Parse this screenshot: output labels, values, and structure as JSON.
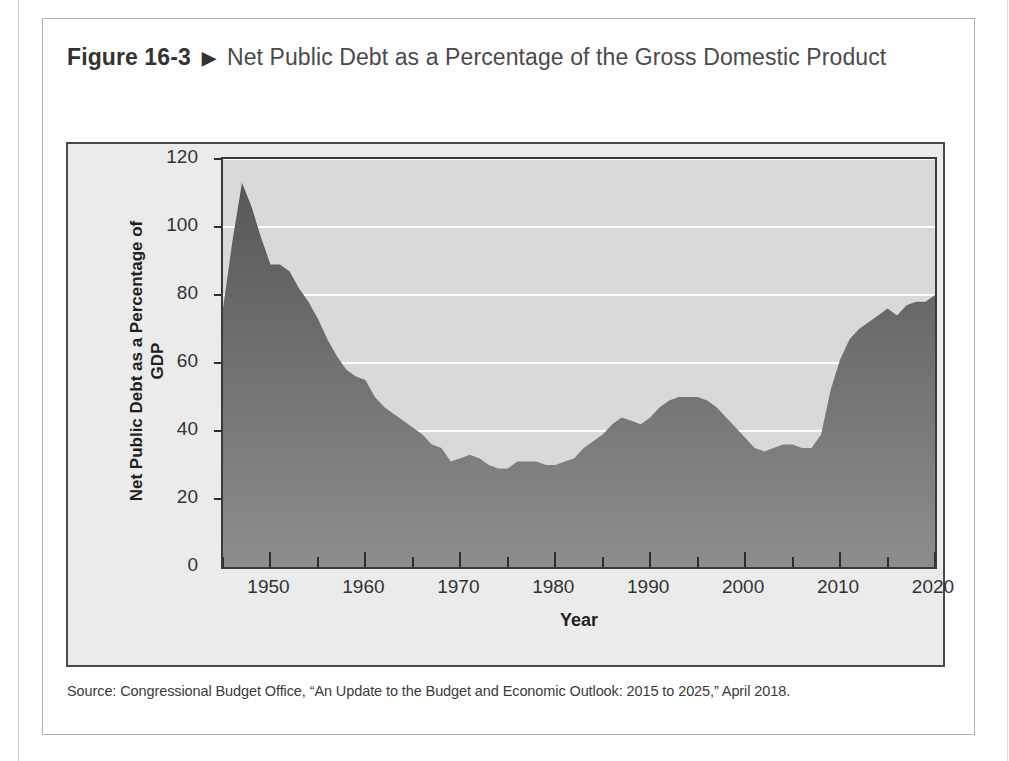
{
  "figure": {
    "number": "Figure 16-3",
    "arrow_icon": "triangle-right-icon",
    "caption": "Net Public Debt as a Percentage of the Gross Domestic Product",
    "source_note": "Source: Congressional Budget Office, “An Update to the Budget and Economic Outlook: 2015 to 2025,” April 2018."
  },
  "colors": {
    "area_fill_top": "#575757",
    "area_fill_bottom": "#8d8d8d",
    "plot_background": "#d9d9d9",
    "panel_background": "#ebebeb",
    "gridline": "#ffffff",
    "axis": "#3a3a3a",
    "text": "#333333"
  },
  "chart_data": {
    "type": "area",
    "title": "Net Public Debt as a Percentage of the Gross Domestic Product",
    "xlabel": "Year",
    "ylabel": "Net Public Debt as a Percentage of GDP",
    "xlim": [
      1945,
      2020
    ],
    "ylim": [
      0,
      120
    ],
    "ytick_labels": [
      "0",
      "20",
      "40",
      "60",
      "80",
      "100",
      "120"
    ],
    "ytick_values": [
      0,
      20,
      40,
      60,
      80,
      100,
      120
    ],
    "xtick_labels": [
      "1950",
      "1960",
      "1970",
      "1980",
      "1990",
      "2000",
      "2010",
      "2020"
    ],
    "xtick_values": [
      1950,
      1960,
      1970,
      1980,
      1990,
      2000,
      2010,
      2020
    ],
    "xtick_minor_values": [
      1945,
      1955,
      1965,
      1975,
      1985,
      1995,
      2005,
      2015
    ],
    "grid": "horizontal",
    "legend": "none",
    "series": [
      {
        "name": "Net Public Debt as a Percentage of GDP",
        "x": [
          1945,
          1946,
          1947,
          1948,
          1949,
          1950,
          1951,
          1952,
          1953,
          1954,
          1955,
          1956,
          1957,
          1958,
          1959,
          1960,
          1961,
          1962,
          1963,
          1964,
          1965,
          1966,
          1967,
          1968,
          1969,
          1970,
          1971,
          1972,
          1973,
          1974,
          1975,
          1976,
          1977,
          1978,
          1979,
          1980,
          1981,
          1982,
          1983,
          1984,
          1985,
          1986,
          1987,
          1988,
          1989,
          1990,
          1991,
          1992,
          1993,
          1994,
          1995,
          1996,
          1997,
          1998,
          1999,
          2000,
          2001,
          2002,
          2003,
          2004,
          2005,
          2006,
          2007,
          2008,
          2009,
          2010,
          2011,
          2012,
          2013,
          2014,
          2015,
          2016,
          2017,
          2018,
          2019,
          2020
        ],
        "values": [
          76,
          96,
          113,
          106,
          97,
          89,
          89,
          87,
          82,
          78,
          73,
          67,
          62,
          58,
          56,
          55,
          50,
          47,
          45,
          43,
          41,
          39,
          36,
          35,
          31,
          32,
          33,
          32,
          30,
          29,
          29,
          31,
          31,
          31,
          30,
          30,
          31,
          32,
          35,
          37,
          39,
          42,
          44,
          43,
          42,
          44,
          47,
          49,
          50,
          50,
          50,
          49,
          47,
          44,
          41,
          38,
          35,
          34,
          35,
          36,
          36,
          35,
          35,
          39,
          52,
          61,
          67,
          70,
          72,
          74,
          76,
          74,
          77,
          78,
          78,
          80
        ]
      }
    ]
  }
}
